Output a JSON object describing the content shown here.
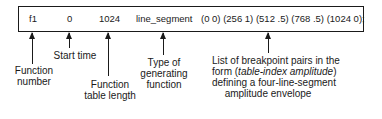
{
  "statement": {
    "function_number": "f1",
    "start_time": "0",
    "table_length": "1024",
    "generator": "line_segment",
    "breakpoints": "(0 0) (256 1) (512 .5) (768 .5) (1024 0);"
  },
  "labels": {
    "function_number": [
      "Function",
      "number"
    ],
    "start_time": [
      "Start time"
    ],
    "table_length": [
      "Function",
      "table length"
    ],
    "generator": [
      "Type of",
      "generating",
      "function"
    ],
    "breakpoints_line1": "List of breakpoint pairs in the",
    "breakpoints_line2_prefix": "form (",
    "breakpoints_line2_italic": "table-index  amplitude",
    "breakpoints_line2_suffix": ")",
    "breakpoints_line3": "defining a four-line-segment",
    "breakpoints_line4": "amplitude envelope"
  }
}
